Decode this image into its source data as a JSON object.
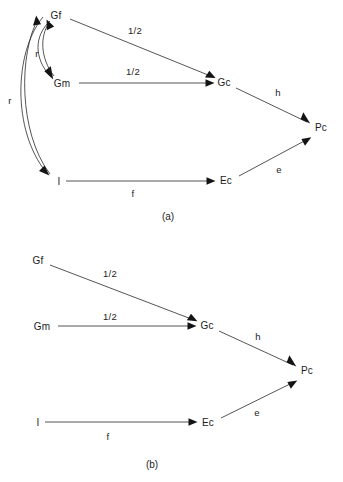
{
  "figures": [
    {
      "id": "a",
      "caption": "(a)",
      "caption_pos": {
        "x": 168,
        "y": 216
      },
      "nodes": [
        {
          "id": "Gf",
          "label": "Gf",
          "x": 56,
          "y": 15
        },
        {
          "id": "Gm",
          "label": "Gm",
          "x": 62,
          "y": 83
        },
        {
          "id": "I",
          "label": "I",
          "x": 59,
          "y": 181
        },
        {
          "id": "Gc",
          "label": "Gc",
          "x": 224,
          "y": 82
        },
        {
          "id": "Ec",
          "label": "Ec",
          "x": 226,
          "y": 180
        },
        {
          "id": "Pc",
          "label": "Pc",
          "x": 321,
          "y": 127
        }
      ],
      "edges": [
        {
          "from": "Gf",
          "to": "Gc",
          "label": "1/2",
          "label_pos": {
            "x": 135,
            "y": 31
          }
        },
        {
          "from": "Gm",
          "to": "Gc",
          "label": "1/2",
          "label_pos": {
            "x": 133,
            "y": 72
          }
        },
        {
          "from": "Gc",
          "to": "Pc",
          "label": "h",
          "label_pos": {
            "x": 278,
            "y": 93
          }
        },
        {
          "from": "Ec",
          "to": "Pc",
          "label": "e",
          "label_pos": {
            "x": 279,
            "y": 170
          }
        },
        {
          "from": "I",
          "to": "Ec",
          "label": "f",
          "label_pos": {
            "x": 133,
            "y": 194
          }
        },
        {
          "from": "Gf",
          "to": "Gm",
          "label": "r",
          "label_pos": {
            "x": 37,
            "y": 54
          },
          "curved": true
        },
        {
          "from": "Gm",
          "to": "Gf",
          "label": "",
          "label_pos": {
            "x": 0,
            "y": 0
          },
          "curved": true
        },
        {
          "from": "Gf",
          "to": "I",
          "label": "r",
          "label_pos": {
            "x": 10,
            "y": 101
          },
          "curved": true
        },
        {
          "from": "I",
          "to": "Gf",
          "label": "",
          "label_pos": {
            "x": 0,
            "y": 0
          },
          "curved": true
        }
      ]
    },
    {
      "id": "b",
      "caption": "(b)",
      "caption_pos": {
        "x": 152,
        "y": 232
      },
      "nodes": [
        {
          "id": "Gf",
          "label": "Gf",
          "x": 38,
          "y": 28
        },
        {
          "id": "Gm",
          "label": "Gm",
          "x": 42,
          "y": 94
        },
        {
          "id": "I",
          "label": "I",
          "x": 38,
          "y": 190
        },
        {
          "id": "Gc",
          "label": "Gc",
          "x": 207,
          "y": 93
        },
        {
          "id": "Ec",
          "label": "Ec",
          "x": 208,
          "y": 190
        },
        {
          "id": "Pc",
          "label": "Pc",
          "x": 307,
          "y": 138
        }
      ],
      "edges": [
        {
          "from": "Gf",
          "to": "Gc",
          "label": "1/2",
          "label_pos": {
            "x": 110,
            "y": 42
          }
        },
        {
          "from": "Gm",
          "to": "Gc",
          "label": "1/2",
          "label_pos": {
            "x": 110,
            "y": 85
          }
        },
        {
          "from": "Gc",
          "to": "Pc",
          "label": "h",
          "label_pos": {
            "x": 258,
            "y": 105
          }
        },
        {
          "from": "Ec",
          "to": "Pc",
          "label": "e",
          "label_pos": {
            "x": 257,
            "y": 181
          }
        },
        {
          "from": "I",
          "to": "Ec",
          "label": "f",
          "label_pos": {
            "x": 108,
            "y": 205
          }
        }
      ]
    }
  ],
  "colors": {
    "background": "#ffffff",
    "stroke": "#2a2a2a",
    "text": "#1c1c1c"
  }
}
